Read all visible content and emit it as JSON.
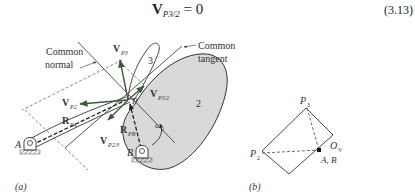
{
  "equation": {
    "vector": "V",
    "subscript": "P3/2",
    "rhs": "= 0",
    "number": "(3.13)"
  },
  "figure_a": {
    "caption": "(a)",
    "labels": {
      "common_normal_1": "Common",
      "common_normal_2": "normal",
      "common_tangent_1": "Common",
      "common_tangent_2": "tangent",
      "v_p3": "V",
      "v_p3_sub": "P3",
      "v_p2": "V",
      "v_p2_sub": "P2",
      "v_p3_2": "V",
      "v_p3_2_sub": "P3/2",
      "v_p2_3": "V",
      "v_p2_3_sub": "P2/3",
      "r_pa": "R",
      "r_pa_sub": "PA",
      "r_pb": "R",
      "r_pb_sub": "PB",
      "omega": "ω",
      "omega_sub": "2",
      "point_p": "P",
      "pivot_a": "A",
      "pivot_b": "B",
      "link_3": "3",
      "link_2": "2"
    }
  },
  "figure_b": {
    "caption": "(b)",
    "labels": {
      "p3": "P",
      "p3_sub": "3",
      "p2": "P",
      "p2_sub": "2",
      "ov": "O",
      "ov_sub": "V",
      "ab": "A, B"
    }
  },
  "colors": {
    "cam_fill": "#d9d9d9",
    "vector_green": "#3a5a3a",
    "line": "#333333"
  }
}
